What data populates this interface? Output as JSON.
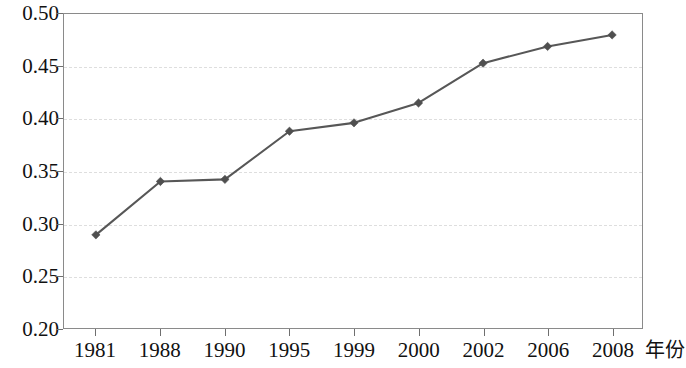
{
  "chart_data": {
    "type": "line",
    "title": "",
    "subtitle": "",
    "xlabel": "年份",
    "ylabel": "",
    "categories": [
      "1981",
      "1988",
      "1990",
      "1995",
      "1999",
      "2000",
      "2002",
      "2006",
      "2008"
    ],
    "values": [
      0.289,
      0.34,
      0.342,
      0.388,
      0.396,
      0.415,
      0.453,
      0.469,
      0.48
    ],
    "series": [
      {
        "name": "",
        "values": [
          0.289,
          0.34,
          0.342,
          0.388,
          0.396,
          0.415,
          0.453,
          0.469,
          0.48
        ]
      }
    ],
    "ylim": [
      0.2,
      0.5
    ],
    "yticks": [
      0.5,
      0.45,
      0.4,
      0.35,
      0.3,
      0.25,
      0.2
    ],
    "ytick_labels": [
      "0.50",
      "0.45",
      "0.40",
      "0.35",
      "0.30",
      "0.25",
      "0.20"
    ],
    "xtick_labels": [
      "1981",
      "1988",
      "1990",
      "1995",
      "1999",
      "2000",
      "2002",
      "2006",
      "2008"
    ],
    "grid": true,
    "grid_axis": "y",
    "grid_style": "dashed",
    "legend": false,
    "legend_position": "none",
    "marker": "diamond",
    "line_color": "#575757",
    "marker_color": "#4f4f4f",
    "grid_color": "#dedede",
    "axis_color": "#8a8a8a",
    "background_color": "#ffffff",
    "annotations": []
  }
}
